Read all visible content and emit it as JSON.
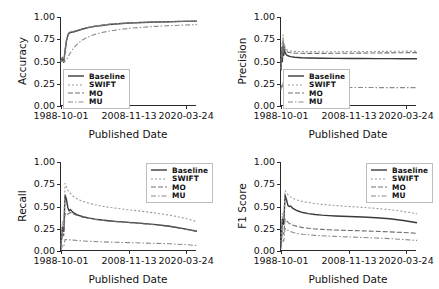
{
  "figure": {
    "background": "#ffffff",
    "layout": "2x2 grid of line charts",
    "shared_xlabel": "Published Date",
    "xticklabels": [
      "1988-10-01",
      "2008-11-13",
      "2020-03-24"
    ],
    "yticklabels": [
      "0.00",
      "0.25",
      "0.50",
      "0.75",
      "1.00"
    ]
  },
  "series_styles": {
    "Baseline": {
      "dash": "none",
      "color": "#3a3a3a",
      "width": 1.4
    },
    "SWIFT": {
      "dash": "2,2",
      "color": "#9a9a9a",
      "width": 1.1
    },
    "MO": {
      "dash": "5,2",
      "color": "#6f6f6f",
      "width": 1.1
    },
    "MU": {
      "dash": "5,2,1.5,2",
      "color": "#8a8a8a",
      "width": 1.1
    }
  },
  "legend": {
    "entries": [
      "Baseline",
      "SWIFT",
      "MO",
      "MU"
    ]
  },
  "chart_data": [
    {
      "type": "line",
      "id": "accuracy",
      "title": "",
      "xlabel": "Published Date",
      "ylabel": "Accuracy",
      "ylim": [
        0.0,
        1.0
      ],
      "yticks": [
        0.0,
        0.25,
        0.5,
        0.75,
        1.0
      ],
      "xticklabels": [
        "1988-10-01",
        "2008-11-13",
        "2020-03-24"
      ],
      "xtick_positions": [
        0.0,
        0.5,
        0.92
      ],
      "grid": false,
      "legend_position": "lower left inside",
      "x": [
        0.0,
        0.01,
        0.02,
        0.03,
        0.04,
        0.05,
        0.06,
        0.08,
        0.1,
        0.13,
        0.16,
        0.2,
        0.25,
        0.3,
        0.35,
        0.4,
        0.5,
        0.6,
        0.7,
        0.8,
        0.9,
        1.0
      ],
      "series": [
        {
          "name": "Baseline",
          "values": [
            0.5,
            0.54,
            0.49,
            0.62,
            0.73,
            0.79,
            0.82,
            0.83,
            0.835,
            0.85,
            0.865,
            0.88,
            0.895,
            0.905,
            0.915,
            0.922,
            0.932,
            0.938,
            0.943,
            0.947,
            0.951,
            0.954
          ]
        },
        {
          "name": "SWIFT",
          "values": [
            0.5,
            0.55,
            0.5,
            0.63,
            0.74,
            0.8,
            0.83,
            0.84,
            0.845,
            0.858,
            0.872,
            0.886,
            0.9,
            0.91,
            0.918,
            0.925,
            0.934,
            0.94,
            0.945,
            0.949,
            0.952,
            0.955
          ]
        },
        {
          "name": "MO",
          "values": [
            0.5,
            0.545,
            0.495,
            0.625,
            0.735,
            0.795,
            0.825,
            0.835,
            0.84,
            0.854,
            0.868,
            0.883,
            0.897,
            0.907,
            0.916,
            0.923,
            0.933,
            0.939,
            0.944,
            0.948,
            0.9515,
            0.9545
          ]
        },
        {
          "name": "MU",
          "values": [
            0.5,
            0.505,
            0.5,
            0.505,
            0.52,
            0.545,
            0.575,
            0.625,
            0.665,
            0.71,
            0.745,
            0.775,
            0.805,
            0.825,
            0.84,
            0.852,
            0.872,
            0.885,
            0.895,
            0.903,
            0.909,
            0.915
          ]
        }
      ]
    },
    {
      "type": "line",
      "id": "precision",
      "title": "",
      "xlabel": "Published Date",
      "ylabel": "Precision",
      "ylim": [
        0.0,
        1.0
      ],
      "yticks": [
        0.0,
        0.25,
        0.5,
        0.75,
        1.0
      ],
      "xticklabels": [
        "1988-10-01",
        "2008-11-13",
        "2020-03-24"
      ],
      "xtick_positions": [
        0.0,
        0.5,
        0.92
      ],
      "grid": false,
      "legend_position": "lower left inside",
      "x": [
        0.0,
        0.005,
        0.01,
        0.015,
        0.02,
        0.025,
        0.03,
        0.04,
        0.05,
        0.07,
        0.1,
        0.15,
        0.2,
        0.3,
        0.4,
        0.5,
        0.6,
        0.7,
        0.8,
        0.9,
        1.0
      ],
      "series": [
        {
          "name": "Baseline",
          "values": [
            0.4,
            0.62,
            0.5,
            0.68,
            0.57,
            0.64,
            0.6,
            0.575,
            0.565,
            0.555,
            0.548,
            0.542,
            0.54,
            0.537,
            0.535,
            0.534,
            0.533,
            0.532,
            0.532,
            0.531,
            0.531
          ]
        },
        {
          "name": "SWIFT",
          "values": [
            0.42,
            0.7,
            0.55,
            0.8,
            0.63,
            0.7,
            0.66,
            0.635,
            0.625,
            0.618,
            0.614,
            0.612,
            0.611,
            0.61,
            0.61,
            0.611,
            0.612,
            0.613,
            0.614,
            0.616,
            0.617
          ]
        },
        {
          "name": "MO",
          "values": [
            0.41,
            0.66,
            0.53,
            0.74,
            0.6,
            0.67,
            0.635,
            0.615,
            0.605,
            0.598,
            0.594,
            0.592,
            0.591,
            0.591,
            0.592,
            0.593,
            0.594,
            0.596,
            0.597,
            0.599,
            0.6
          ]
        },
        {
          "name": "MU",
          "values": [
            0.18,
            0.24,
            0.2,
            0.26,
            0.21,
            0.225,
            0.215,
            0.212,
            0.211,
            0.21,
            0.209,
            0.209,
            0.208,
            0.208,
            0.208,
            0.208,
            0.208,
            0.207,
            0.207,
            0.207,
            0.207
          ]
        }
      ]
    },
    {
      "type": "line",
      "id": "recall",
      "title": "",
      "xlabel": "Published Date",
      "ylabel": "Recall",
      "ylim": [
        0.0,
        1.0
      ],
      "yticks": [
        0.0,
        0.25,
        0.5,
        0.75,
        1.0
      ],
      "xticklabels": [
        "1988-10-01",
        "2008-11-13",
        "2020-03-24"
      ],
      "xtick_positions": [
        0.0,
        0.5,
        0.92
      ],
      "grid": false,
      "legend_position": "upper right inside",
      "x": [
        0.0,
        0.01,
        0.02,
        0.03,
        0.04,
        0.05,
        0.06,
        0.07,
        0.09,
        0.12,
        0.16,
        0.2,
        0.25,
        0.3,
        0.35,
        0.4,
        0.5,
        0.6,
        0.7,
        0.8,
        0.9,
        1.0
      ],
      "series": [
        {
          "name": "Baseline",
          "values": [
            0.05,
            0.27,
            0.22,
            0.63,
            0.58,
            0.49,
            0.45,
            0.465,
            0.43,
            0.405,
            0.385,
            0.372,
            0.358,
            0.348,
            0.34,
            0.333,
            0.322,
            0.31,
            0.296,
            0.278,
            0.252,
            0.222
          ]
        },
        {
          "name": "SWIFT",
          "values": [
            0.06,
            0.33,
            0.27,
            0.76,
            0.72,
            0.685,
            0.66,
            0.645,
            0.615,
            0.585,
            0.558,
            0.54,
            0.52,
            0.505,
            0.492,
            0.482,
            0.463,
            0.445,
            0.425,
            0.402,
            0.372,
            0.33
          ]
        },
        {
          "name": "MO",
          "values": [
            0.05,
            0.2,
            0.17,
            0.42,
            0.4,
            0.415,
            0.425,
            0.432,
            0.415,
            0.398,
            0.38,
            0.368,
            0.355,
            0.345,
            0.337,
            0.33,
            0.319,
            0.307,
            0.293,
            0.275,
            0.249,
            0.219
          ]
        },
        {
          "name": "MU",
          "values": [
            0.01,
            0.06,
            0.05,
            0.13,
            0.128,
            0.127,
            0.126,
            0.125,
            0.122,
            0.118,
            0.113,
            0.11,
            0.106,
            0.103,
            0.1,
            0.098,
            0.094,
            0.09,
            0.086,
            0.081,
            0.073,
            0.062
          ]
        }
      ]
    },
    {
      "type": "line",
      "id": "f1_score",
      "title": "",
      "xlabel": "Published Date",
      "ylabel": "F1 Score",
      "ylim": [
        0.0,
        1.0
      ],
      "yticks": [
        0.0,
        0.25,
        0.5,
        0.75,
        1.0
      ],
      "xticklabels": [
        "1988-10-01",
        "2008-11-13",
        "2020-03-24"
      ],
      "xtick_positions": [
        0.0,
        0.5,
        0.92
      ],
      "grid": false,
      "legend_position": "upper right inside",
      "x": [
        0.0,
        0.01,
        0.02,
        0.03,
        0.04,
        0.05,
        0.06,
        0.07,
        0.09,
        0.12,
        0.16,
        0.2,
        0.25,
        0.3,
        0.35,
        0.4,
        0.5,
        0.6,
        0.7,
        0.8,
        0.9,
        1.0
      ],
      "series": [
        {
          "name": "Baseline",
          "values": [
            0.08,
            0.36,
            0.3,
            0.63,
            0.58,
            0.515,
            0.5,
            0.505,
            0.475,
            0.452,
            0.432,
            0.42,
            0.41,
            0.403,
            0.398,
            0.394,
            0.388,
            0.382,
            0.374,
            0.362,
            0.343,
            0.318
          ]
        },
        {
          "name": "SWIFT",
          "values": [
            0.1,
            0.42,
            0.35,
            0.68,
            0.655,
            0.635,
            0.62,
            0.608,
            0.59,
            0.572,
            0.556,
            0.545,
            0.533,
            0.524,
            0.517,
            0.511,
            0.5,
            0.49,
            0.478,
            0.464,
            0.444,
            0.418
          ]
        },
        {
          "name": "MO",
          "values": [
            0.06,
            0.22,
            0.19,
            0.36,
            0.345,
            0.325,
            0.31,
            0.305,
            0.29,
            0.276,
            0.263,
            0.256,
            0.248,
            0.243,
            0.239,
            0.236,
            0.231,
            0.226,
            0.221,
            0.215,
            0.208,
            0.199
          ]
        },
        {
          "name": "MU",
          "values": [
            0.02,
            0.13,
            0.11,
            0.255,
            0.245,
            0.232,
            0.222,
            0.218,
            0.208,
            0.198,
            0.188,
            0.182,
            0.176,
            0.171,
            0.167,
            0.164,
            0.158,
            0.152,
            0.146,
            0.139,
            0.13,
            0.119
          ]
        }
      ]
    }
  ]
}
